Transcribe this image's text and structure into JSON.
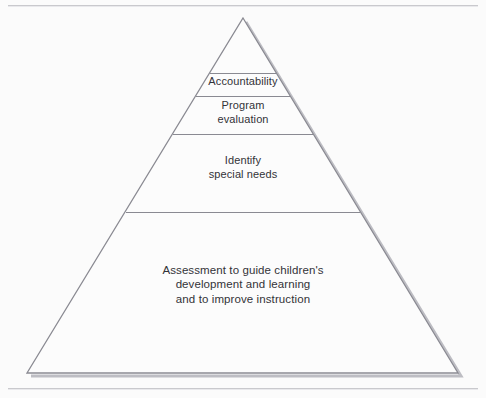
{
  "figure": {
    "type": "pyramid-hierarchy-diagram",
    "background_color": "#fbfbfb",
    "outline_color": "#8a8a92",
    "shadow_color": "#b9b9bf",
    "text_color": "#333338",
    "apex": {
      "x": 243,
      "y": 18
    },
    "base_left": {
      "x": 27,
      "y": 373
    },
    "base_right": {
      "x": 458,
      "y": 373
    },
    "divider_y": [
      73,
      96,
      134,
      212
    ]
  },
  "rules": {
    "top_label": "top-horizontal-rule",
    "bottom_label": "bottom-horizontal-rule"
  },
  "tiers": [
    {
      "id": "accountability",
      "label": "Accountability"
    },
    {
      "id": "program-evaluation",
      "label": "Program\nevaluation"
    },
    {
      "id": "identify-special-needs",
      "label": "Identify\nspecial needs"
    },
    {
      "id": "assessment-to-guide",
      "label": "Assessment to guide children's\ndevelopment and learning\nand to improve instruction"
    }
  ]
}
